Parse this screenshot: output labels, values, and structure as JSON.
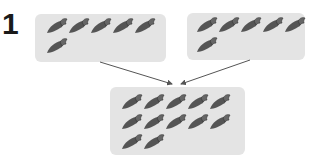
{
  "problem": {
    "number": "1",
    "groups": [
      {
        "name": "left-group",
        "count": 6,
        "rows": [
          5,
          1
        ]
      },
      {
        "name": "right-group",
        "count": 6,
        "rows": [
          5,
          1
        ]
      }
    ],
    "result": {
      "name": "combined-group",
      "count": 12,
      "rows": [
        5,
        5,
        2
      ]
    },
    "item_icon": "carrot-icon",
    "colors": {
      "box": "#e4e4e4",
      "carrot": "#555555",
      "arrow": "#555555"
    }
  }
}
